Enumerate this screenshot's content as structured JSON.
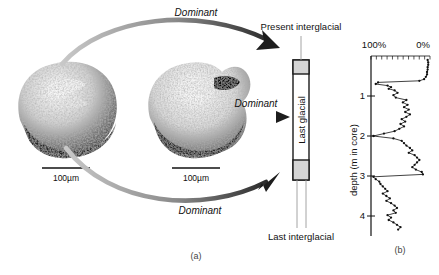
{
  "figure": {
    "panel_a_caption": "(a)",
    "panel_b_caption": "(b)"
  },
  "specimens": [
    {
      "name": "foraminifera-left",
      "scale_label": "100µm"
    },
    {
      "name": "foraminifera-right",
      "scale_label": "100µm"
    }
  ],
  "arrows": [
    {
      "name": "arrow-top-curved",
      "label": "Dominant",
      "style": "curved"
    },
    {
      "name": "arrow-middle-straight",
      "label": "Dominant",
      "style": "straight"
    },
    {
      "name": "arrow-bottom-curved",
      "label": "Dominant",
      "style": "curved"
    }
  ],
  "core": {
    "top_label": "Present interglacial",
    "middle_label": "Last glacial",
    "bottom_label": "Last interglacial",
    "band_color": "#d4d4d4",
    "outline_color": "#1a1a1a"
  },
  "chart_data": {
    "type": "line",
    "title": "",
    "xlabel": "",
    "ylabel": "depth (m in core)",
    "x_tick_labels": [
      "100%",
      "0%"
    ],
    "x_tick_values": [
      100,
      0
    ],
    "xlim": [
      100,
      0
    ],
    "x_axis_reversed": true,
    "ylim": [
      0,
      4.5
    ],
    "y_ticks": [
      1,
      2,
      3,
      4
    ],
    "y_tick_labels": [
      "1",
      "2",
      "3",
      "4"
    ],
    "grid": false,
    "legend": false,
    "marker": "filled-circle",
    "series": [
      {
        "name": "percent abundance",
        "points": [
          [
            0.1,
            4
          ],
          [
            0.16,
            3
          ],
          [
            0.22,
            3
          ],
          [
            0.28,
            4
          ],
          [
            0.34,
            4
          ],
          [
            0.4,
            5
          ],
          [
            0.46,
            5
          ],
          [
            0.52,
            7
          ],
          [
            0.58,
            10
          ],
          [
            0.62,
            18
          ],
          [
            0.66,
            88
          ],
          [
            0.7,
            92
          ],
          [
            0.74,
            72
          ],
          [
            0.78,
            66
          ],
          [
            0.82,
            70
          ],
          [
            0.86,
            60
          ],
          [
            0.92,
            55
          ],
          [
            0.98,
            62
          ],
          [
            1.04,
            58
          ],
          [
            1.1,
            40
          ],
          [
            1.16,
            46
          ],
          [
            1.22,
            38
          ],
          [
            1.28,
            44
          ],
          [
            1.34,
            36
          ],
          [
            1.4,
            42
          ],
          [
            1.46,
            34
          ],
          [
            1.52,
            40
          ],
          [
            1.58,
            48
          ],
          [
            1.64,
            42
          ],
          [
            1.7,
            50
          ],
          [
            1.76,
            44
          ],
          [
            1.82,
            52
          ],
          [
            1.88,
            60
          ],
          [
            1.94,
            78
          ],
          [
            2.0,
            96
          ],
          [
            2.06,
            62
          ],
          [
            2.12,
            48
          ],
          [
            2.18,
            44
          ],
          [
            2.24,
            40
          ],
          [
            2.3,
            34
          ],
          [
            2.36,
            30
          ],
          [
            2.42,
            36
          ],
          [
            2.48,
            26
          ],
          [
            2.54,
            22
          ],
          [
            2.6,
            18
          ],
          [
            2.66,
            22
          ],
          [
            2.72,
            26
          ],
          [
            2.78,
            30
          ],
          [
            2.84,
            24
          ],
          [
            2.9,
            14
          ],
          [
            2.96,
            12
          ],
          [
            3.02,
            96
          ],
          [
            3.08,
            92
          ],
          [
            3.14,
            86
          ],
          [
            3.2,
            84
          ],
          [
            3.26,
            80
          ],
          [
            3.32,
            76
          ],
          [
            3.38,
            72
          ],
          [
            3.44,
            80
          ],
          [
            3.5,
            74
          ],
          [
            3.56,
            68
          ],
          [
            3.62,
            74
          ],
          [
            3.68,
            66
          ],
          [
            3.74,
            60
          ],
          [
            3.8,
            56
          ],
          [
            3.86,
            62
          ],
          [
            3.92,
            58
          ],
          [
            3.98,
            72
          ],
          [
            4.04,
            66
          ],
          [
            4.1,
            70
          ],
          [
            4.16,
            62
          ],
          [
            4.22,
            56
          ],
          [
            4.28,
            50
          ],
          [
            4.34,
            54
          ]
        ]
      }
    ]
  }
}
